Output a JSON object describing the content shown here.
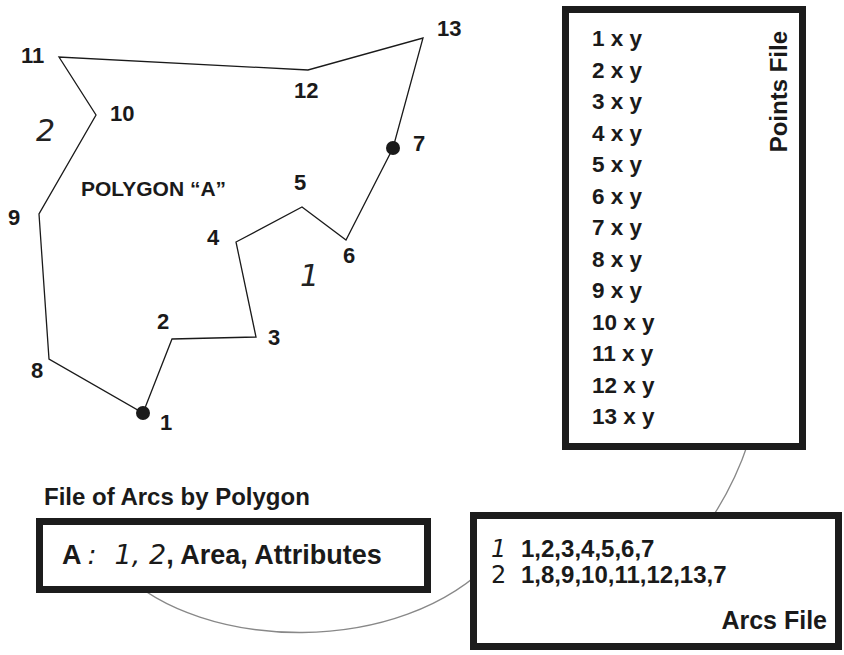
{
  "polygon": {
    "label": "POLYGON “A”",
    "vertices": [
      {
        "id": "1",
        "x": 143,
        "y": 413
      },
      {
        "id": "2",
        "x": 172,
        "y": 339
      },
      {
        "id": "3",
        "x": 256,
        "y": 337
      },
      {
        "id": "4",
        "x": 236,
        "y": 242
      },
      {
        "id": "5",
        "x": 302,
        "y": 207
      },
      {
        "id": "6",
        "x": 346,
        "y": 240
      },
      {
        "id": "7",
        "x": 393,
        "y": 148
      },
      {
        "id": "13",
        "x": 423,
        "y": 38
      },
      {
        "id": "12",
        "x": 308,
        "y": 70
      },
      {
        "id": "11",
        "x": 59,
        "y": 57
      },
      {
        "id": "10",
        "x": 96,
        "y": 115
      },
      {
        "id": "9",
        "x": 39,
        "y": 214
      },
      {
        "id": "8",
        "x": 49,
        "y": 359
      }
    ],
    "point_labels": [
      {
        "text": "1",
        "x": 160,
        "y": 412
      },
      {
        "text": "2",
        "x": 157,
        "y": 311
      },
      {
        "text": "3",
        "x": 268,
        "y": 327
      },
      {
        "text": "4",
        "x": 207,
        "y": 227
      },
      {
        "text": "5",
        "x": 294,
        "y": 172
      },
      {
        "text": "6",
        "x": 343,
        "y": 245
      },
      {
        "text": "7",
        "x": 413,
        "y": 133
      },
      {
        "text": "8",
        "x": 31,
        "y": 360
      },
      {
        "text": "9",
        "x": 8,
        "y": 207
      },
      {
        "text": "10",
        "x": 110,
        "y": 103
      },
      {
        "text": "11",
        "x": 21,
        "y": 45
      },
      {
        "text": "12",
        "x": 294,
        "y": 80
      },
      {
        "text": "13",
        "x": 437,
        "y": 18
      }
    ],
    "arc_labels": [
      {
        "text": "1",
        "x": 300,
        "y": 262
      },
      {
        "text": "2",
        "x": 36,
        "y": 117
      }
    ],
    "nodes": [
      "1",
      "7"
    ]
  },
  "points_file": {
    "title": "Points File",
    "rows": [
      "1 x y",
      "2 x y",
      "3 x y",
      "4 x y",
      "5 x y",
      "6 x y",
      "7 x y",
      "8 x y",
      "9 x y",
      "10 x y",
      "11 x y",
      "12 x y",
      "13 x y"
    ]
  },
  "arcs_by_polygon": {
    "title": "File of Arcs by Polygon",
    "polygon_id": "A",
    "separator": ":",
    "arc1": "1",
    "arc2": "2",
    "rest": ", Area, Attributes"
  },
  "arcs_file": {
    "title": "Arcs File",
    "rows": [
      {
        "id": "1",
        "points": "1,2,3,4,5,6,7"
      },
      {
        "id": "2",
        "points": "1,8,9,10,11,12,13,7"
      }
    ]
  },
  "colors": {
    "line": "#1a1a1a",
    "connector": "#888888",
    "box_border": "#1c1c1c"
  }
}
